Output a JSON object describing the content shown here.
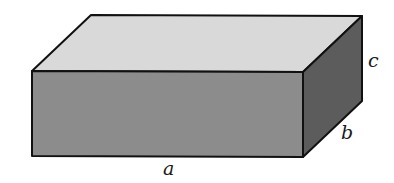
{
  "figure": {
    "type": "rectangular-prism",
    "labels": {
      "length": "a",
      "depth": "b",
      "height": "c"
    },
    "colors": {
      "top_face": "#d9d9d9",
      "front_face": "#8c8c8c",
      "side_face": "#5c5c5c",
      "edge": "#111111",
      "background": "#ffffff"
    }
  }
}
